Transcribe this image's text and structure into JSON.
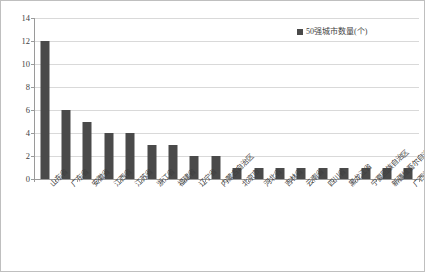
{
  "chart_data": {
    "type": "bar",
    "title": "",
    "xlabel": "",
    "ylabel": "",
    "ylim": [
      0,
      14
    ],
    "yticks": [
      0,
      2,
      4,
      6,
      8,
      10,
      12,
      14
    ],
    "grid": true,
    "legend_position": "top-right",
    "series_name": "50强城市数量(个)",
    "bar_color": "#4a4a4a",
    "gridline_color": "#d9d9d9",
    "axis_color": "#9a9a9a",
    "border_color": "#bfbfbf",
    "background_color": "#ffffff",
    "categories": [
      "山东省",
      "广东省",
      "安徽省",
      "江西省",
      "江苏省",
      "浙江省",
      "福建省",
      "辽宁省",
      "内蒙古自治区",
      "北京市",
      "河北省",
      "吉林省",
      "云南省",
      "四川省",
      "黑龙江省",
      "宁夏回族自治区",
      "新疆维吾尔自治区",
      "广西壮族自治区"
    ],
    "values": [
      12,
      6,
      5,
      4,
      4,
      3,
      3,
      2,
      2,
      1,
      1,
      1,
      1,
      1,
      1,
      1,
      1,
      1
    ]
  },
  "legend": {
    "items": [
      {
        "label": "50强城市数量(个)",
        "color": "#4a4a4a"
      }
    ]
  }
}
